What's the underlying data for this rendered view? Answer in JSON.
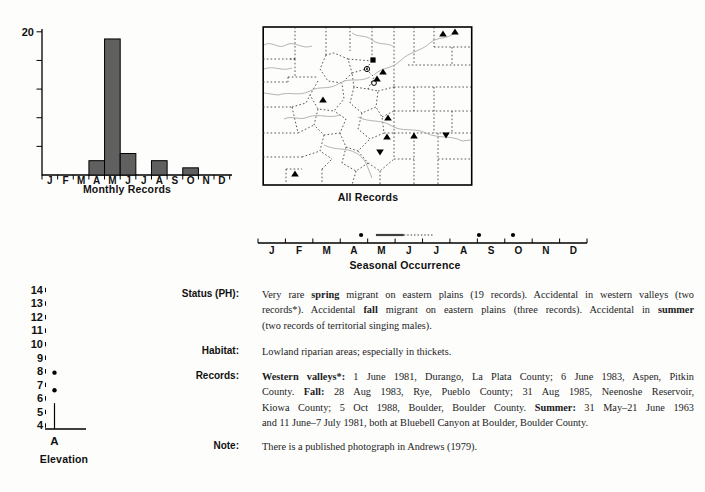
{
  "months": [
    "J",
    "F",
    "M",
    "A",
    "M",
    "J",
    "J",
    "A",
    "S",
    "O",
    "N",
    "D"
  ],
  "monthly_chart": {
    "type": "bar",
    "title": "Monthly Records",
    "categories": [
      "J",
      "F",
      "M",
      "A",
      "M",
      "J",
      "J",
      "A",
      "S",
      "O",
      "N",
      "D"
    ],
    "values": [
      0,
      0,
      0,
      2,
      19,
      3,
      0,
      2,
      0,
      1,
      0,
      0
    ],
    "ylim": [
      0,
      20
    ],
    "yticks": [
      4,
      8,
      12,
      16,
      20
    ],
    "ymax_label": "20",
    "bar_color": "#606060"
  },
  "map": {
    "label": "All Records",
    "markers": [
      {
        "type": "triangle-up",
        "x": 181,
        "y": 9
      },
      {
        "type": "triangle-up",
        "x": 193,
        "y": 7
      },
      {
        "type": "square",
        "x": 111,
        "y": 35
      },
      {
        "type": "circle-dot",
        "x": 105,
        "y": 44
      },
      {
        "type": "triangle-up",
        "x": 121,
        "y": 47
      },
      {
        "type": "triangle-up",
        "x": 115,
        "y": 54
      },
      {
        "type": "circle",
        "x": 112,
        "y": 58
      },
      {
        "type": "triangle-up",
        "x": 61,
        "y": 75
      },
      {
        "type": "triangle-up",
        "x": 126,
        "y": 93
      },
      {
        "type": "triangle-up",
        "x": 125,
        "y": 112
      },
      {
        "type": "triangle-up",
        "x": 152,
        "y": 111
      },
      {
        "type": "triangle-down",
        "x": 184,
        "y": 110
      },
      {
        "type": "triangle-down",
        "x": 118,
        "y": 127
      },
      {
        "type": "triangle-up",
        "x": 33,
        "y": 149
      }
    ]
  },
  "seasonal": {
    "title": "Seasonal Occurrence",
    "months": [
      "J",
      "F",
      "M",
      "A",
      "M",
      "J",
      "J",
      "A",
      "S",
      "O",
      "N",
      "D"
    ],
    "dots_months": [
      3.76,
      8.06,
      9.3
    ],
    "solid_bar": [
      4.3,
      5.32
    ],
    "dotted_bar": [
      5.32,
      6.42
    ]
  },
  "elevation": {
    "title": "Elevation",
    "category": "A",
    "yticks": [
      4,
      5,
      6,
      7,
      8,
      9,
      10,
      11,
      12,
      13,
      14
    ],
    "dots": [
      6.6,
      7.9
    ],
    "whisker_top": 5.65
  },
  "sections": [
    {
      "label": "Status (PH):",
      "lines": [
        [
          {
            "t": "Very rare "
          },
          {
            "t": "spring",
            "b": 1
          },
          {
            "t": " migrant on eastern plains (19 records). Accidental in western valleys (two"
          }
        ],
        [
          {
            "t": "records*). Accidental "
          },
          {
            "t": "fall",
            "b": 1
          },
          {
            "t": " migrant on eastern plains (three records). Accidental in "
          },
          {
            "t": "summer",
            "b": 1
          }
        ],
        [
          {
            "t": "(two records of territorial singing males)."
          }
        ]
      ]
    },
    {
      "label": "Habitat:",
      "lines": [
        [
          {
            "t": "Lowland riparian areas; especially in thickets."
          }
        ]
      ]
    },
    {
      "label": "Records:",
      "lines": [
        [
          {
            "t": "Western valleys*:",
            "b": 1
          },
          {
            "t": " 1 June 1981, Durango, La Plata County; 6 June 1983, Aspen, Pitkin"
          }
        ],
        [
          {
            "t": "County. "
          },
          {
            "t": "Fall:",
            "b": 1
          },
          {
            "t": " 28 Aug 1983, Rye, Pueblo County; 31 Aug 1985, Neenoshe Reservoir,"
          }
        ],
        [
          {
            "t": "Kiowa County; 5 Oct 1988, Boulder, Boulder County. "
          },
          {
            "t": "Summer:",
            "b": 1
          },
          {
            "t": " 31 May–21 June 1963"
          }
        ],
        [
          {
            "t": "and 11 June–7 July 1981, both at Bluebell Canyon at Boulder, Boulder County."
          }
        ]
      ]
    },
    {
      "label": "Note:",
      "lines": [
        [
          {
            "t": "There is a published photograph in Andrews (1979)."
          }
        ]
      ]
    }
  ]
}
